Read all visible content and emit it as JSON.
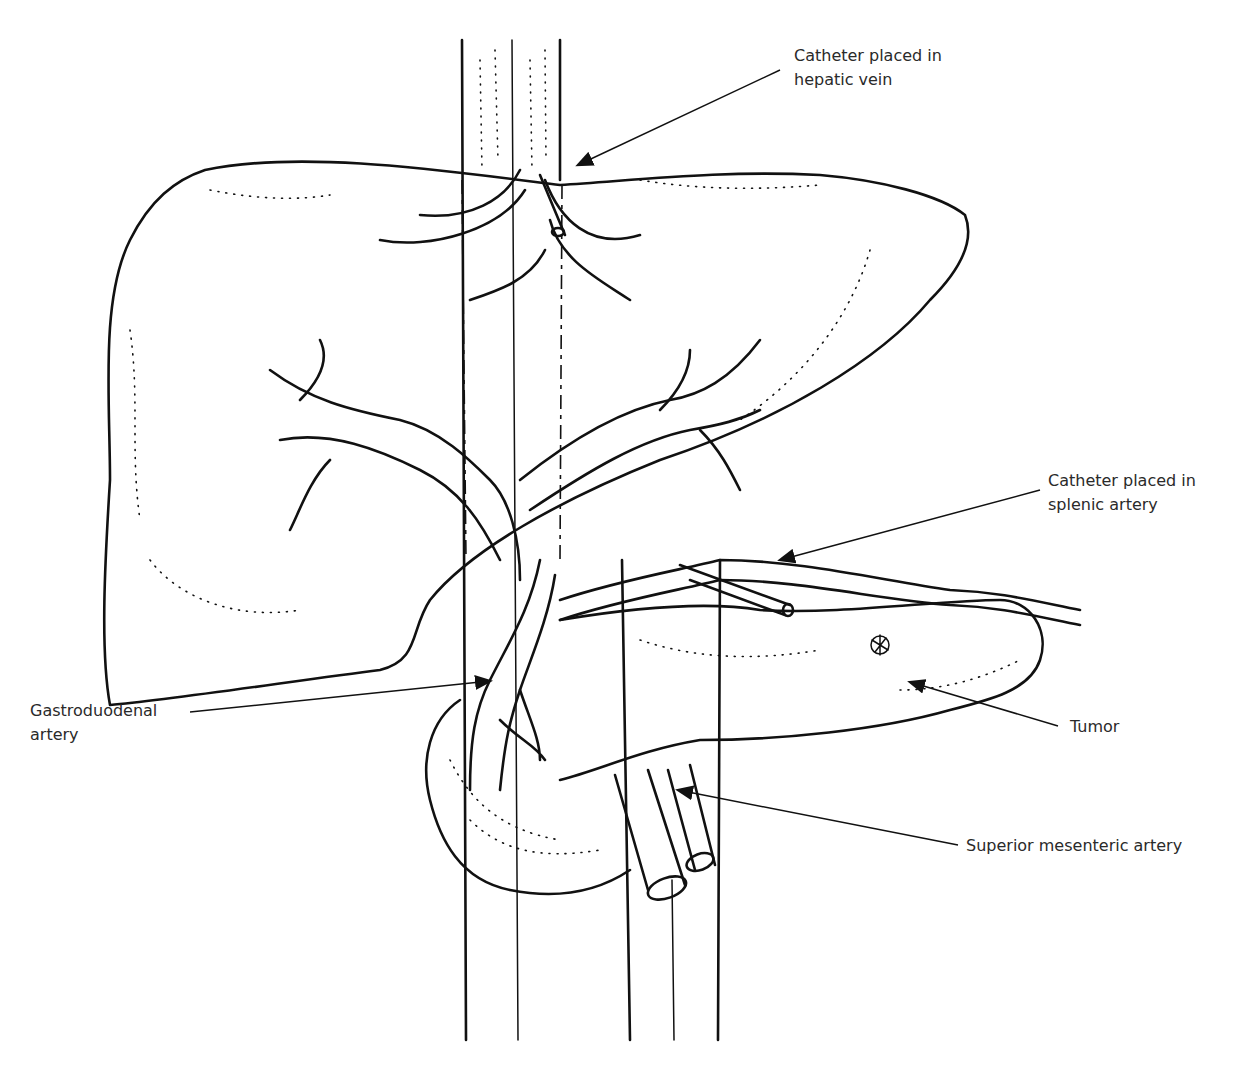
{
  "figure": {
    "line_color": "#111111",
    "background": "#ffffff"
  },
  "labels": {
    "hepatic_vein_catheter": "Catheter placed in\nhepatic vein",
    "splenic_artery_catheter": "Catheter placed in\nsplenic artery",
    "gastroduodenal_artery": "Gastroduodenal\nartery",
    "tumor": "Tumor",
    "superior_mesenteric_artery": "Superior mesenteric artery"
  }
}
